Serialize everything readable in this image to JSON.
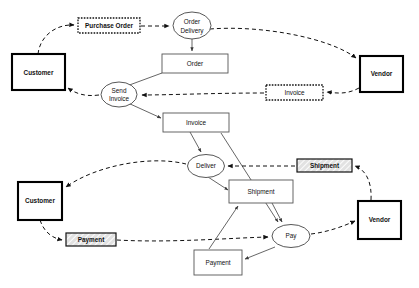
{
  "diagram": {
    "type": "process-flow-diagram",
    "background_color": "#ffffff",
    "nodes": [
      {
        "id": "customer_top",
        "label": "Customer",
        "kind": "actor",
        "shape": "rect-bold",
        "x": 12,
        "y": 54,
        "w": 53,
        "h": 36
      },
      {
        "id": "purchase_order",
        "label": "Purchase Order",
        "kind": "message",
        "shape": "rect-dotted",
        "x": 78,
        "y": 18,
        "w": 62,
        "h": 15
      },
      {
        "id": "order_delivery",
        "label": "Order Delivery",
        "kind": "activity",
        "shape": "ellipse",
        "x": 173,
        "y": 12,
        "w": 38,
        "h": 27
      },
      {
        "id": "order",
        "label": "Order",
        "kind": "object",
        "shape": "rect",
        "x": 162,
        "y": 54,
        "w": 66,
        "h": 19
      },
      {
        "id": "vendor_top",
        "label": "Vendor",
        "kind": "actor",
        "shape": "rect-bold",
        "x": 360,
        "y": 56,
        "w": 43,
        "h": 36
      },
      {
        "id": "send_invoice",
        "label": "Send Invoice",
        "kind": "activity",
        "shape": "ellipse",
        "x": 101,
        "y": 82,
        "w": 36,
        "h": 25
      },
      {
        "id": "invoice_msg",
        "label": "Invoice",
        "kind": "message",
        "shape": "rect-dotted",
        "x": 266,
        "y": 85,
        "w": 57,
        "h": 15
      },
      {
        "id": "invoice_obj",
        "label": "Invoice",
        "kind": "object",
        "shape": "rect",
        "x": 163,
        "y": 113,
        "w": 66,
        "h": 19
      },
      {
        "id": "deliver",
        "label": "Deliver",
        "kind": "activity",
        "shape": "ellipse",
        "x": 187,
        "y": 155,
        "w": 37,
        "h": 23
      },
      {
        "id": "shipment_msg",
        "label": "Shipment",
        "kind": "message",
        "shape": "rect-hatch",
        "x": 297,
        "y": 159,
        "w": 55,
        "h": 13
      },
      {
        "id": "shipment_obj",
        "label": "Shipment",
        "kind": "object",
        "shape": "rect",
        "x": 229,
        "y": 180,
        "w": 64,
        "h": 23
      },
      {
        "id": "customer_bottom",
        "label": "Customer",
        "kind": "actor",
        "shape": "rect-bold",
        "x": 18,
        "y": 182,
        "w": 44,
        "h": 38
      },
      {
        "id": "vendor_bottom",
        "label": "Vendor",
        "kind": "actor",
        "shape": "rect-bold",
        "x": 358,
        "y": 201,
        "w": 43,
        "h": 38
      },
      {
        "id": "payment_msg",
        "label": "Payment",
        "kind": "message",
        "shape": "rect-hatch",
        "x": 66,
        "y": 233,
        "w": 50,
        "h": 13
      },
      {
        "id": "pay",
        "label": "Pay",
        "kind": "activity",
        "shape": "ellipse",
        "x": 272,
        "y": 225,
        "w": 38,
        "h": 23
      },
      {
        "id": "payment_obj",
        "label": "Payment",
        "kind": "object",
        "shape": "rect",
        "x": 194,
        "y": 250,
        "w": 48,
        "h": 25
      }
    ],
    "edges": [
      {
        "from": "customer_top",
        "to": "purchase_order",
        "style": "dashed"
      },
      {
        "from": "purchase_order",
        "to": "order_delivery",
        "style": "dashed"
      },
      {
        "from": "order_delivery",
        "to": "vendor_top",
        "style": "dashed"
      },
      {
        "from": "order_delivery",
        "to": "order",
        "style": "solid"
      },
      {
        "from": "order",
        "to": "send_invoice",
        "style": "solid"
      },
      {
        "from": "vendor_top",
        "to": "invoice_msg",
        "style": "dashed"
      },
      {
        "from": "invoice_msg",
        "to": "send_invoice",
        "style": "dashed"
      },
      {
        "from": "send_invoice",
        "to": "customer_top",
        "style": "dashed"
      },
      {
        "from": "send_invoice",
        "to": "invoice_obj",
        "style": "solid"
      },
      {
        "from": "invoice_obj",
        "to": "deliver",
        "style": "solid"
      },
      {
        "from": "invoice_obj",
        "to": "pay",
        "style": "solid"
      },
      {
        "from": "deliver",
        "to": "customer_bottom",
        "style": "dashed"
      },
      {
        "from": "deliver",
        "to": "shipment_obj",
        "style": "solid"
      },
      {
        "from": "shipment_msg",
        "to": "deliver",
        "style": "dashed"
      },
      {
        "from": "vendor_bottom",
        "to": "shipment_msg",
        "style": "dashed"
      },
      {
        "from": "shipment_obj",
        "to": "pay",
        "style": "solid"
      },
      {
        "from": "customer_bottom",
        "to": "payment_msg",
        "style": "dashed"
      },
      {
        "from": "payment_msg",
        "to": "pay",
        "style": "dashed"
      },
      {
        "from": "pay",
        "to": "vendor_bottom",
        "style": "dashed"
      },
      {
        "from": "pay",
        "to": "payment_obj",
        "style": "solid"
      },
      {
        "from": "payment_obj",
        "to": "shipment_obj",
        "style": "solid"
      }
    ]
  }
}
